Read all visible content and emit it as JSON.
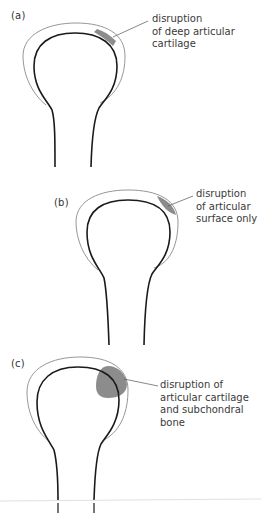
{
  "figure": {
    "colors": {
      "bone_outline": "#1a1a1a",
      "cartilage_outline": "#8a8a8a",
      "lesion_fill": "#8c8c8c",
      "leader_line": "#555555",
      "text": "#3a3a3a",
      "baseline_rule": "#d8d8d8"
    },
    "panels": [
      {
        "id": "a",
        "label": "(a)",
        "callout": "disruption\nof deep articular\ncartilage",
        "lesion_type": "thin band along deep cartilage"
      },
      {
        "id": "b",
        "label": "(b)",
        "callout": "disruption\nof articular\nsurface only",
        "lesion_type": "lens on cartilage surface"
      },
      {
        "id": "c",
        "label": "(c)",
        "callout": "disruption of\narticular cartilage\nand subchondral\nbone",
        "lesion_type": "blob through cartilage into bone"
      }
    ]
  }
}
